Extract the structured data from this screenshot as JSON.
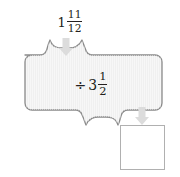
{
  "diagram": {
    "type": "function-machine",
    "title": "",
    "input": {
      "label": "1 11/12",
      "whole": "1",
      "numerator": "11",
      "denominator": "12"
    },
    "operation": {
      "label": "÷ 3 1/2",
      "sign": "÷",
      "whole": "3",
      "numerator": "1",
      "denominator": "2"
    },
    "output": {
      "label": "",
      "placeholder": ""
    },
    "arrows": {
      "input_arrow": "arrow-down-icon",
      "output_arrow": "arrow-down-icon"
    },
    "colors": {
      "machine_fill": "#f0f0f0",
      "machine_stroke": "#8a8a8a",
      "arrow_fill": "#dcdcdc",
      "output_fill": "#ffffff",
      "output_stroke": "#b0b0b0",
      "text": "#231f20"
    }
  }
}
